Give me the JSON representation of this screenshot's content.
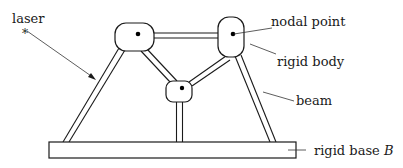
{
  "diagram": {
    "labels": {
      "laser": "laser",
      "laser_marker": "*",
      "nodal_point": "nodal point",
      "rigid_body": "rigid body",
      "beam": "beam",
      "rigid_base": "rigid base ",
      "rigid_base_symbol": "B"
    },
    "nodes": [
      {
        "id": "left-node",
        "x": 115,
        "y": 23,
        "w": 39,
        "h": 28,
        "dot": [
          138,
          34
        ]
      },
      {
        "id": "right-node",
        "x": 218,
        "y": 17,
        "w": 26,
        "h": 40,
        "dot": [
          233,
          34
        ]
      },
      {
        "id": "middle-node",
        "x": 166,
        "y": 81,
        "w": 26,
        "h": 21,
        "dot": [
          182,
          88
        ]
      }
    ],
    "base": {
      "x": 49,
      "y": 142,
      "w": 247,
      "h": 16
    },
    "colors": {
      "line": "#1a1a1a",
      "background": "#ffffff"
    }
  }
}
